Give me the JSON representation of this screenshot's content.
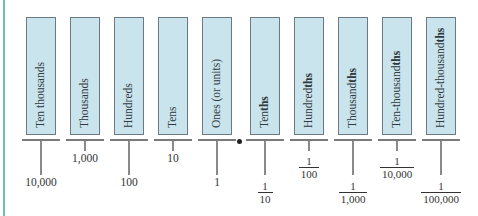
{
  "diagram": {
    "decimal_point": "•",
    "columns": [
      {
        "label": "Ten thousands",
        "suffix": "",
        "value": "10,000",
        "type": "whole",
        "level": "low"
      },
      {
        "label": "Thousands",
        "suffix": "",
        "value": "1,000",
        "type": "whole",
        "level": "high"
      },
      {
        "label": "Hundreds",
        "suffix": "",
        "value": "100",
        "type": "whole",
        "level": "low"
      },
      {
        "label": "Tens",
        "suffix": "",
        "value": "10",
        "type": "whole",
        "level": "high"
      },
      {
        "label": "Ones (or units)",
        "suffix": "",
        "value": "1",
        "type": "whole",
        "level": "low"
      },
      {
        "label": "Ten",
        "suffix": "ths",
        "num": "1",
        "den": "10",
        "type": "fraction",
        "level": "low"
      },
      {
        "label": "Hundred",
        "suffix": "ths",
        "num": "1",
        "den": "100",
        "type": "fraction",
        "level": "high"
      },
      {
        "label": "Thousand",
        "suffix": "ths",
        "num": "1",
        "den": "1,000",
        "type": "fraction",
        "level": "low"
      },
      {
        "label": "Ten-thousand",
        "suffix": "ths",
        "num": "1",
        "den": "10,000",
        "type": "fraction",
        "level": "high"
      },
      {
        "label": "Hundred-thousand",
        "suffix": "ths",
        "num": "1",
        "den": "100,000",
        "type": "fraction",
        "level": "low"
      }
    ]
  },
  "colors": {
    "box_fill": "#c9e4ec",
    "box_border": "#6b7a80",
    "accent_rule": "#6cc0b4"
  }
}
